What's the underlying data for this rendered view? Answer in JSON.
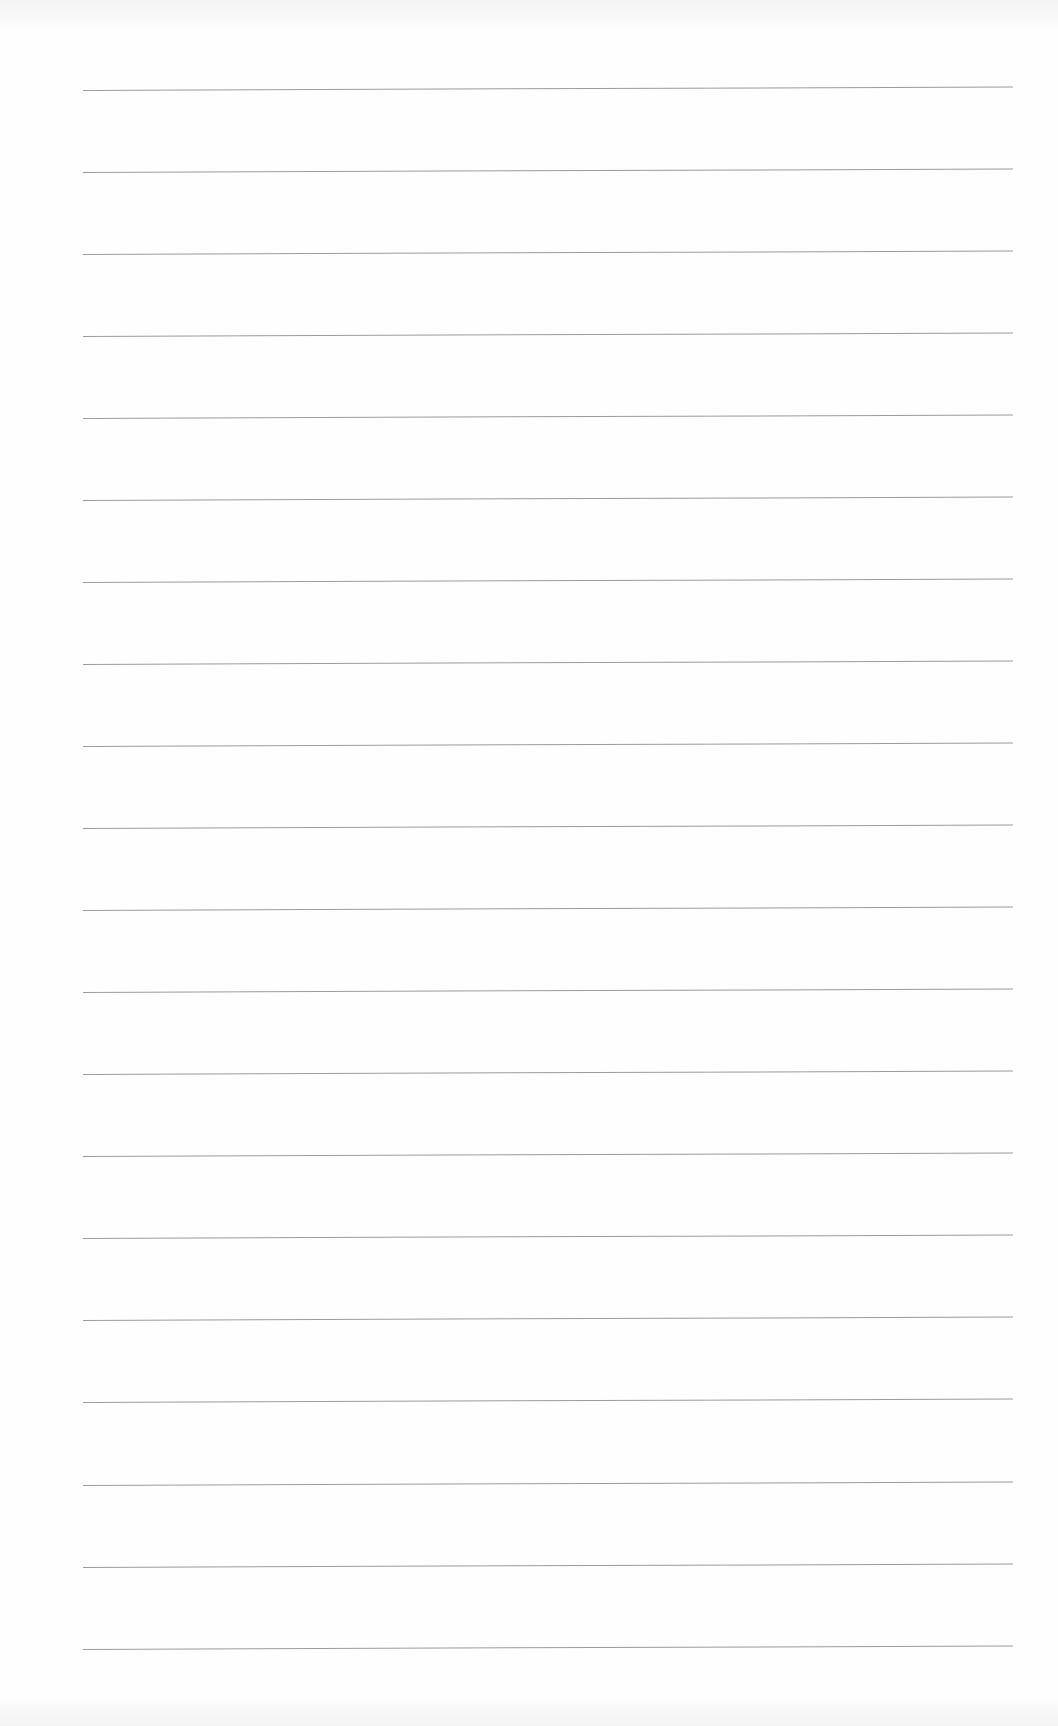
{
  "document": {
    "type": "ruled-paper",
    "line_count": 20,
    "line_color": "#8a8a8a",
    "background_color": "#fefefe",
    "lines": [
      {
        "top": 90
      },
      {
        "top": 172
      },
      {
        "top": 254
      },
      {
        "top": 336
      },
      {
        "top": 418
      },
      {
        "top": 500
      },
      {
        "top": 582
      },
      {
        "top": 664
      },
      {
        "top": 746
      },
      {
        "top": 828
      },
      {
        "top": 910
      },
      {
        "top": 992
      },
      {
        "top": 1074
      },
      {
        "top": 1156
      },
      {
        "top": 1238
      },
      {
        "top": 1320
      },
      {
        "top": 1402
      },
      {
        "top": 1485
      },
      {
        "top": 1567
      },
      {
        "top": 1649
      }
    ]
  }
}
